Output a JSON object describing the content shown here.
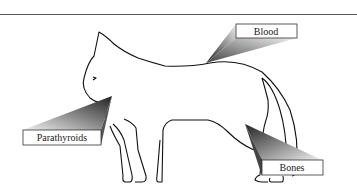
{
  "diagram": {
    "labels": {
      "blood": "Blood",
      "parathyroids": "Parathyroids",
      "bones": "Bones"
    }
  }
}
